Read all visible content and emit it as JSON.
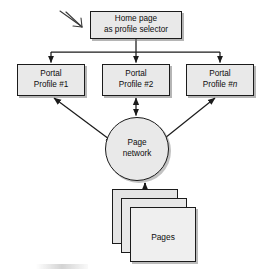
{
  "diagram": {
    "type": "flow-diagram",
    "background_color": "#ffffff",
    "node_fill_color": "#e9e9e9",
    "line_color": "#1b1b1b",
    "nodes": {
      "home": {
        "shape": "rectangle",
        "line1": "Home page",
        "line2": "as profile selector"
      },
      "profile1": {
        "shape": "rectangle",
        "line1": "Portal",
        "line2_prefix": "Profile #",
        "line2_suffix": "1"
      },
      "profile2": {
        "shape": "rectangle",
        "line1": "Portal",
        "line2_prefix": "Profile #",
        "line2_suffix": "2"
      },
      "profileN": {
        "shape": "rectangle",
        "line1": "Portal",
        "line2_prefix": "Profile #",
        "line2_suffix": "n"
      },
      "network": {
        "shape": "circle",
        "line1": "Page",
        "line2": "network"
      },
      "pages": {
        "shape": "stacked-sheets",
        "sheet_count": 3,
        "label": "Pages"
      }
    },
    "annotations": {
      "pointer": "hand-drawn-arrow-icon"
    },
    "edges": [
      {
        "from": "home",
        "to": "profile1",
        "style": "orthogonal",
        "arrow": "to-target"
      },
      {
        "from": "home",
        "to": "profile2",
        "style": "orthogonal",
        "arrow": "to-target"
      },
      {
        "from": "home",
        "to": "profileN",
        "style": "orthogonal",
        "arrow": "to-target"
      },
      {
        "from": "network",
        "to": "profile1",
        "style": "diagonal",
        "arrow": "both"
      },
      {
        "from": "network",
        "to": "profile2",
        "style": "vertical",
        "arrow": "both"
      },
      {
        "from": "network",
        "to": "profileN",
        "style": "diagonal",
        "arrow": "both"
      },
      {
        "from": "pages",
        "to": "network",
        "style": "vertical",
        "arrow": "to-target"
      }
    ]
  }
}
